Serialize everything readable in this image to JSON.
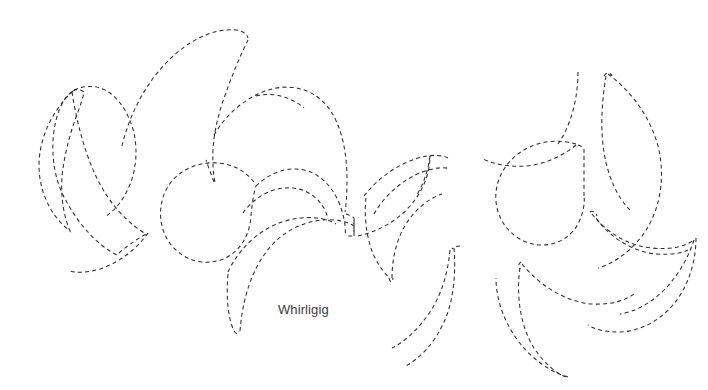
{
  "figure": {
    "title": "Whirligig",
    "background_color": "#ffffff",
    "stroke_color": "#2b2b2b",
    "stroke_width": 1.05,
    "dash_pattern": "4 3.2",
    "width": 708,
    "height": 390,
    "style": "dashed-outline line art",
    "caption": {
      "text": "Whirligig",
      "x": 278,
      "y": 314,
      "font_size": 13,
      "color": "#3b3b3b"
    },
    "clusters": [
      {
        "name": "left-whirligig",
        "center_x": 120,
        "center_y": 150,
        "blade_count": 3
      },
      {
        "name": "center-whirligig",
        "center_x": 290,
        "center_y": 190,
        "blade_count": 5
      },
      {
        "name": "right-whirligig",
        "center_x": 575,
        "center_y": 205,
        "blade_count": 5
      }
    ],
    "blades": [
      {
        "id": "L1",
        "cluster": "left-whirligig",
        "path": "M 70 92 C 58 108 40 140 42 174 C 44 206 62 232 86 248 C 108 262 124 257 133 249 C 114 240 96 222 88 205 C 80 187 78 162 82 142 C 85 124 89 108 92 98 C 86 92 78 89 70 92 Z"
      },
      {
        "id": "L2",
        "cluster": "left-whirligig",
        "path": "M 68 94 C 76 120 86 150 104 176 C 120 200 142 218 166 228 C 150 235 131 242 119 251 C 97 242 76 220 63 193 C 50 166 49 129 59 106 C 62 99 65 96 68 94 Z"
      },
      {
        "id": "L3",
        "cluster": "left-whirligig",
        "path": "M 130 243 C 120 254 106 264 92 270 C 78 275 70 275 66 274"
      },
      {
        "id": "L-outer-top",
        "cluster": "left-whirligig",
        "path": "M 69 93 C 80 88 92 91 98 97"
      },
      {
        "id": "C1",
        "cluster": "center-whirligig",
        "path": "M 243 39 C 218 44 186 60 165 86 C 144 112 134 130 129 141 C 134 134 142 128 150 124 C 141 133 132 142 126 150"
      },
      {
        "id": "C2",
        "cluster": "center-whirligig",
        "path": "M 246 40 C 238 58 228 84 222 106 C 216 125 214 138 215 147"
      },
      {
        "id": "C3",
        "cluster": "center-whirligig",
        "path": "M 255 102 C 282 95 312 101 330 120 C 348 140 352 170 348 196"
      },
      {
        "id": "C4",
        "cluster": "center-whirligig",
        "path": "M 163 192 C 168 175 186 165 205 168 C 224 171 239 185 244 200"
      },
      {
        "id": "C5",
        "cluster": "center-whirligig",
        "path": "M 242 208 C 256 190 278 181 296 186 C 314 191 324 206 326 221"
      },
      {
        "id": "C6",
        "cluster": "center-whirligig",
        "path": "M 249 238 C 268 222 294 214 314 216 C 332 218 344 226 350 233"
      },
      {
        "id": "C7",
        "cluster": "center-whirligig",
        "path": "M 232 330 C 226 300 230 266 244 244"
      },
      {
        "id": "R1",
        "cluster": "right-whirligig",
        "path": "M 582 72 C 580 96 574 126 560 146 C 546 166 524 174 500 170"
      },
      {
        "id": "R2",
        "cluster": "right-whirligig",
        "path": "M 608 77 C 630 92 652 118 658 148 C 664 180 652 214 630 238"
      },
      {
        "id": "R3",
        "cluster": "right-whirligig",
        "path": "M 596 214 C 614 228 640 238 662 236 C 678 234 688 229 694 224"
      },
      {
        "id": "R4",
        "cluster": "right-whirligig",
        "path": "M 520 266 C 540 286 566 300 590 300 C 610 300 624 294 632 288"
      },
      {
        "id": "R5",
        "cluster": "right-whirligig",
        "path": "M 518 268 C 514 296 518 330 534 352 C 546 368 556 374 562 376"
      }
    ]
  }
}
